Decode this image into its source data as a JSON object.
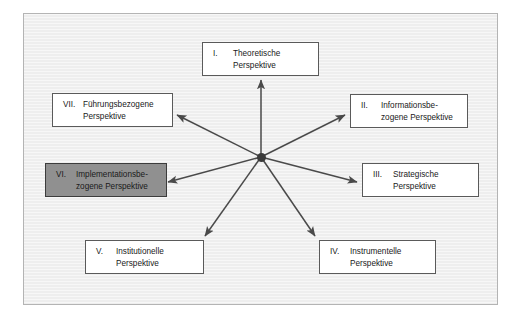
{
  "figure": {
    "background_color": "#eeeeee",
    "frame_color": "#b4b4b4",
    "box_fill": "#ffffff",
    "box_border": "#5a5a5a",
    "highlight_fill": "#909090",
    "hub_color": "#3a3a3a",
    "arrow_color": "#4a4a4a"
  },
  "hub": {
    "name": "center-node",
    "label": ""
  },
  "nodes": [
    {
      "id": "i",
      "numeral": "I.",
      "label": "Theoretische\nPerspektive",
      "highlighted": false
    },
    {
      "id": "ii",
      "numeral": "II.",
      "label": "Informationsbe-\nzogene Perspektive",
      "highlighted": false
    },
    {
      "id": "iii",
      "numeral": "III.",
      "label": "Strategische\nPerspektive",
      "highlighted": false
    },
    {
      "id": "iv",
      "numeral": "IV.",
      "label": "Instrumentelle\nPerspektive",
      "highlighted": false
    },
    {
      "id": "v",
      "numeral": "V.",
      "label": "Institutionelle\nPerspektive",
      "highlighted": false
    },
    {
      "id": "vi",
      "numeral": "VI.",
      "label": "Implementationsbe-\nzogene Perspektive",
      "highlighted": true
    },
    {
      "id": "vii",
      "numeral": "VII.",
      "label": "Führungsbezogene\nPerspektive",
      "highlighted": false
    }
  ]
}
